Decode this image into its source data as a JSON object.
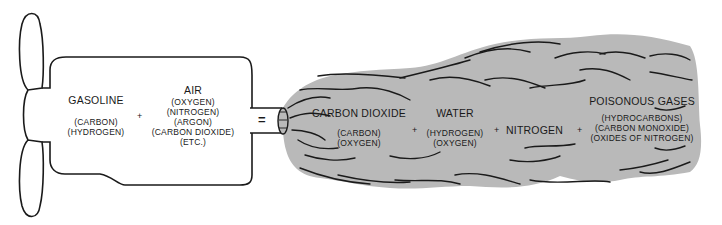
{
  "diagram": {
    "colors": {
      "background": "#ffffff",
      "outline": "#1a1a1a",
      "exhaust_fill": "#b9b9b9",
      "text": "#1a1a1a"
    },
    "inputs": {
      "gasoline": {
        "title": "GASOLINE",
        "components": [
          "(CARBON)",
          "(HYDROGEN)"
        ]
      },
      "plus": "+",
      "air": {
        "title": "AIR",
        "components": [
          "(OXYGEN)",
          "(NITROGEN)",
          "(ARGON)",
          "(CARBON DIOXIDE)",
          "(ETC.)"
        ]
      }
    },
    "equals": "=",
    "outputs": {
      "carbon_dioxide": {
        "title": "CARBON DIOXIDE",
        "components": [
          "(CARBON)",
          "(OXYGEN)"
        ]
      },
      "plus1": "+",
      "water": {
        "title": "WATER",
        "components": [
          "(HYDROGEN)",
          "(OXYGEN)"
        ]
      },
      "plus2": "+",
      "nitrogen": {
        "title": "NITROGEN"
      },
      "plus3": "+",
      "poisonous_gases": {
        "title": "POISONOUS GASES",
        "components": [
          "(HYDROCARBONS)",
          "(CARBON MONOXIDE)",
          "(OXIDES OF NITROGEN)"
        ]
      }
    }
  }
}
